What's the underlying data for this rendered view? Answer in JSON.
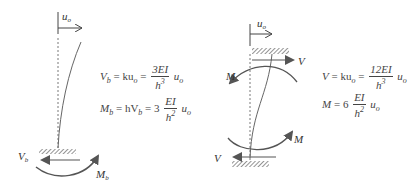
{
  "left_diagram": {
    "displacement_label": "u",
    "displacement_sub": "o",
    "shear_label": "V",
    "shear_sub": "b",
    "moment_label": "M",
    "moment_sub": "b",
    "eq1": {
      "lhs": "V",
      "lhs_sub": "b",
      "mid": "= ku",
      "mid_sub": "o",
      "eq": "=",
      "num": "3EI",
      "den": "h",
      "den_sup": "3",
      "tail": "u",
      "tail_sub": "o"
    },
    "eq2": {
      "lhs": "M",
      "lhs_sub": "b",
      "mid": "= hV",
      "mid_sub": "b",
      "eq": "= 3",
      "num": "EI",
      "den": "h",
      "den_sup": "2",
      "tail": "u",
      "tail_sub": "o"
    }
  },
  "right_diagram": {
    "displacement_label": "u",
    "displacement_sub": "o",
    "top_shear_label": "V",
    "top_moment_label": "M",
    "bottom_moment_label": "M",
    "bottom_shear_label": "V",
    "eq1": {
      "lhs": "V",
      "mid": "= ku",
      "mid_sub": "o",
      "eq": "=",
      "num": "12EI",
      "den": "h",
      "den_sup": "3",
      "tail": "u",
      "tail_sub": "o"
    },
    "eq2": {
      "lhs": "M",
      "eq": "= 6",
      "num": "EI",
      "den": "h",
      "den_sup": "2",
      "tail": "u",
      "tail_sub": "o"
    }
  },
  "colors": {
    "arrow_gray": "#555555",
    "line": "#666666",
    "hatch": "#777777"
  }
}
